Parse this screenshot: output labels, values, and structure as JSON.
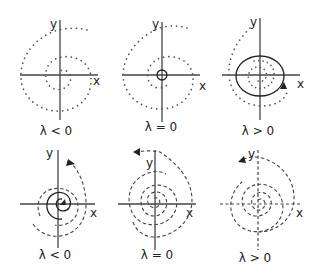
{
  "figure": {
    "axis_labels": {
      "x": "x",
      "y": "y"
    },
    "top_row": {
      "style": "dotted trajectories (discrete map iterates)",
      "panels": [
        {
          "id": "top-neg",
          "caption": "λ < 0",
          "behavior": "dotted spiral inward to stable fixed point"
        },
        {
          "id": "top-zero",
          "caption": "λ = 0",
          "behavior": "dotted spiral with small invariant circle at origin"
        },
        {
          "id": "top-pos",
          "caption": "λ > 0",
          "behavior": "dotted points converge to solid closed invariant curve (limit cycle) with arrow"
        }
      ]
    },
    "bottom_row": {
      "style": "dashed continuous spiral trajectories",
      "panels": [
        {
          "id": "bot-neg",
          "caption": "λ < 0",
          "behavior": "solid inner spiral and dashed outer spiral with outward arrow"
        },
        {
          "id": "bot-zero",
          "caption": "λ = 0",
          "behavior": "dashed spiral expanding outward with arrow"
        },
        {
          "id": "bot-pos",
          "caption": "λ > 0",
          "behavior": "dashed spiral with dashed axes, arrow outward"
        }
      ]
    },
    "colors": {
      "ink": "#222222",
      "dots": "#555555",
      "background": "#ffffff"
    }
  }
}
